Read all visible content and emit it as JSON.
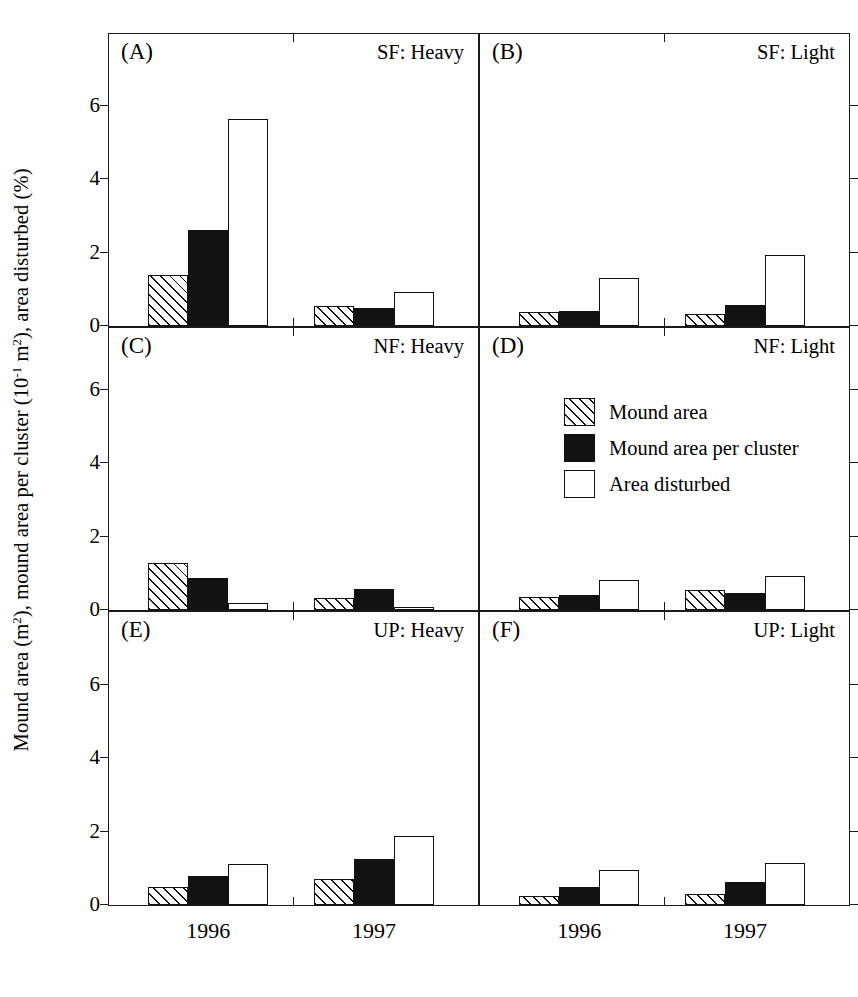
{
  "figure": {
    "ylabel_parts": {
      "a": "Mound area (m",
      "a_sup": "2",
      "b": "), mound area per cluster (10",
      "b_sup": "-1",
      "c": " m",
      "c_sup": "2",
      "d": "), area disturbed (%)"
    },
    "ylabel_plain": "Mound area (m2), mound area per cluster (10-1 m2), area disturbed (%)"
  },
  "legend": {
    "position": "panel-D-upper-left",
    "entries": [
      {
        "key": "mound_area",
        "label": "Mound area",
        "fill": "hatched"
      },
      {
        "key": "mound_area_per_cluster",
        "label": "Mound area per cluster",
        "fill": "solid-black"
      },
      {
        "key": "area_disturbed",
        "label": "Area disturbed",
        "fill": "open-white"
      }
    ]
  },
  "chart_data": {
    "type": "bar",
    "title": "",
    "xlabel": "",
    "ylabel": "Mound area (m2), mound area per cluster (10-1 m2), area disturbed (%)",
    "categories": [
      "1996",
      "1997"
    ],
    "ylim": [
      0,
      8
    ],
    "yticks": [
      0,
      2,
      4,
      6,
      8
    ],
    "yticks_lower_rows": [
      0,
      2,
      4,
      6
    ],
    "grid": false,
    "legend_position": "inside panel D, upper left",
    "series_names": [
      "Mound area",
      "Mound area per cluster",
      "Area disturbed"
    ],
    "panels": [
      {
        "tag": "(A)",
        "title": "SF: Heavy",
        "row": 1,
        "col": 1,
        "yticks": [
          0,
          2,
          4,
          6,
          8
        ],
        "series": [
          {
            "name": "Mound area",
            "values": [
              1.38,
              0.55
            ]
          },
          {
            "name": "Mound area per cluster",
            "values": [
              2.62,
              0.5
            ]
          },
          {
            "name": "Area disturbed",
            "values": [
              5.62,
              0.93
            ]
          }
        ]
      },
      {
        "tag": "(B)",
        "title": "SF: Light",
        "row": 1,
        "col": 2,
        "yticks": [
          0,
          2,
          4,
          6,
          8
        ],
        "series": [
          {
            "name": "Mound area",
            "values": [
              0.38,
              0.33
            ]
          },
          {
            "name": "Mound area per cluster",
            "values": [
              0.4,
              0.58
            ]
          },
          {
            "name": "Area disturbed",
            "values": [
              1.32,
              1.93
            ]
          }
        ]
      },
      {
        "tag": "(C)",
        "title": "NF: Heavy",
        "row": 2,
        "col": 1,
        "yticks": [
          0,
          2,
          4,
          6
        ],
        "series": [
          {
            "name": "Mound area",
            "values": [
              1.28,
              0.32
            ]
          },
          {
            "name": "Mound area per cluster",
            "values": [
              0.88,
              0.57
            ]
          },
          {
            "name": "Area disturbed",
            "values": [
              0.2,
              0.08
            ]
          }
        ]
      },
      {
        "tag": "(D)",
        "title": "NF: Light",
        "row": 2,
        "col": 2,
        "yticks": [
          0,
          2,
          4,
          6
        ],
        "series": [
          {
            "name": "Mound area",
            "values": [
              0.36,
              0.55
            ]
          },
          {
            "name": "Mound area per cluster",
            "values": [
              0.42,
              0.45
            ]
          },
          {
            "name": "Area disturbed",
            "values": [
              0.83,
              0.93
            ]
          }
        ]
      },
      {
        "tag": "(E)",
        "title": "UP: Heavy",
        "row": 3,
        "col": 1,
        "yticks": [
          0,
          2,
          4,
          6
        ],
        "series": [
          {
            "name": "Mound area",
            "values": [
              0.48,
              0.72
            ]
          },
          {
            "name": "Mound area per cluster",
            "values": [
              0.78,
              1.25
            ]
          },
          {
            "name": "Area disturbed",
            "values": [
              1.12,
              1.88
            ]
          }
        ]
      },
      {
        "tag": "(F)",
        "title": "UP: Light",
        "row": 3,
        "col": 2,
        "yticks": [
          0,
          2,
          4,
          6
        ],
        "series": [
          {
            "name": "Mound area",
            "values": [
              0.25,
              0.3
            ]
          },
          {
            "name": "Mound area per cluster",
            "values": [
              0.5,
              0.63
            ]
          },
          {
            "name": "Area disturbed",
            "values": [
              0.95,
              1.13
            ]
          }
        ]
      }
    ]
  },
  "colors": {
    "axis": "#1a1a1a",
    "solid_fill": "#121212",
    "open_fill": "#ffffff",
    "hatch_line": "#111111",
    "background": "#ffffff"
  }
}
